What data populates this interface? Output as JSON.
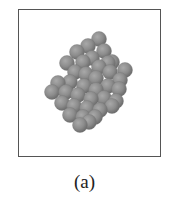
{
  "figure": {
    "caption": "(a)",
    "frame": {
      "x": 18,
      "y": 9,
      "width": 143,
      "height": 148,
      "stroke": "#555555"
    },
    "sphere_color": "#8c8c8c",
    "sphere_highlight": "#a8a8a8",
    "sphere_shadow": "#6e6e6e",
    "sphere_radius": 7.5,
    "spheres": [
      [
        99,
        39
      ],
      [
        88,
        46
      ],
      [
        104,
        51
      ],
      [
        77,
        52
      ],
      [
        92,
        58
      ],
      [
        83,
        62
      ],
      [
        108,
        63
      ],
      [
        112,
        62
      ],
      [
        67,
        63
      ],
      [
        99,
        67
      ],
      [
        75,
        72
      ],
      [
        86,
        74
      ],
      [
        110,
        72
      ],
      [
        125,
        70
      ],
      [
        120,
        80
      ],
      [
        96,
        78
      ],
      [
        70,
        82
      ],
      [
        58,
        83
      ],
      [
        84,
        86
      ],
      [
        108,
        86
      ],
      [
        119,
        89
      ],
      [
        96,
        90
      ],
      [
        52,
        92
      ],
      [
        66,
        92
      ],
      [
        78,
        95
      ],
      [
        91,
        99
      ],
      [
        104,
        98
      ],
      [
        116,
        101
      ],
      [
        62,
        103
      ],
      [
        74,
        106
      ],
      [
        87,
        108
      ],
      [
        100,
        110
      ],
      [
        112,
        106
      ],
      [
        70,
        115
      ],
      [
        83,
        117
      ],
      [
        95,
        117
      ],
      [
        80,
        125
      ],
      [
        89,
        122
      ]
    ]
  }
}
